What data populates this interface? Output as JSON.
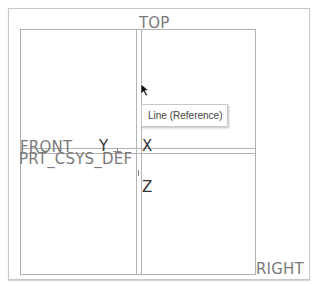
{
  "viewport": {
    "datum_planes": {
      "top": "TOP",
      "front": "FRONT",
      "right": "RIGHT"
    },
    "coordinate_system": {
      "name": "PRT_CSYS_DEF",
      "axes": {
        "x": "X",
        "y": "Y",
        "z": "Z"
      }
    },
    "tooltip": {
      "text": "Line (Reference)"
    },
    "cursor": {
      "icon": "arrow-pointer-icon"
    }
  },
  "colors": {
    "plane_line": "#b4b4b4",
    "plane_label": "#7a7a7a",
    "axis_label": "#333333",
    "background": "#ffffff"
  }
}
